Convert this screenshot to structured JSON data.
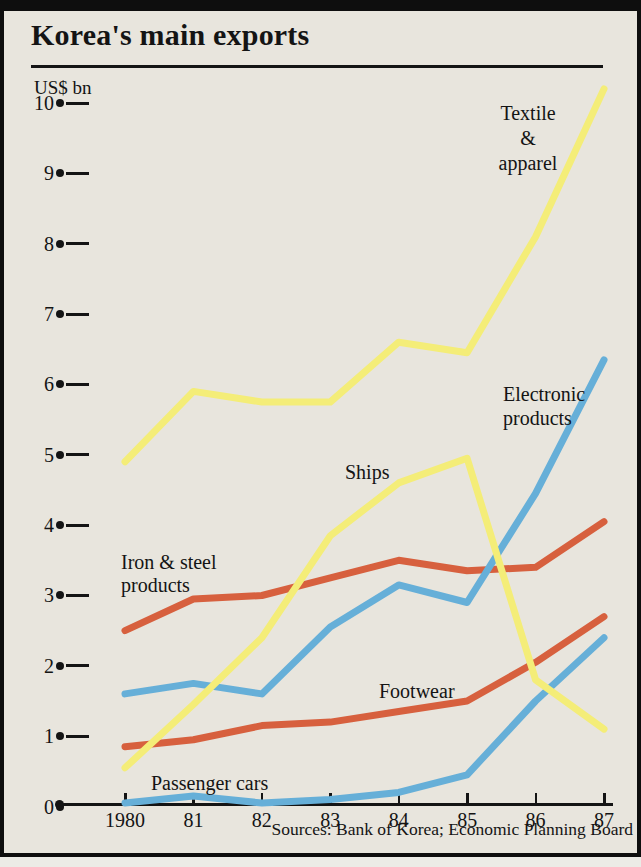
{
  "title": "Korea's main exports",
  "unit_label": "US$ bn",
  "source_line": "Sources: Bank of Korea; Economic Planning Board",
  "colors": {
    "paper": "#e8e5dd",
    "frame": "#0e0e0e",
    "ink": "#141414",
    "yellow": "#f4ed78",
    "blue": "#66afd8",
    "red": "#d7603e"
  },
  "chart_data": {
    "type": "line",
    "title": "Korea's main exports",
    "ylabel": "US$ bn",
    "ylim": [
      0,
      10
    ],
    "y_ticks": [
      0,
      1,
      2,
      3,
      4,
      5,
      6,
      7,
      8,
      9,
      10
    ],
    "grid": false,
    "legend_position": "inline-labels",
    "categories": [
      "1980",
      "81",
      "82",
      "83",
      "84",
      "85",
      "86",
      "87"
    ],
    "series": [
      {
        "name": "Iron & steel products",
        "label": "Iron & steel\nproducts",
        "color_key": "red",
        "values": [
          2.5,
          2.95,
          3.0,
          3.25,
          3.5,
          3.35,
          3.4,
          4.05
        ]
      },
      {
        "name": "Footwear",
        "label": "Footwear",
        "color_key": "red",
        "values": [
          0.85,
          0.95,
          1.15,
          1.2,
          1.35,
          1.5,
          2.05,
          2.7
        ]
      },
      {
        "name": "Passenger cars",
        "label": "Passenger cars",
        "color_key": "blue",
        "values": [
          0.05,
          0.15,
          0.05,
          0.1,
          0.2,
          0.45,
          1.5,
          2.4
        ]
      },
      {
        "name": "Electronic products",
        "label": "Electronic\nproducts",
        "color_key": "blue",
        "values": [
          1.6,
          1.75,
          1.6,
          2.55,
          3.15,
          2.9,
          4.45,
          6.35
        ]
      },
      {
        "name": "Ships",
        "label": "Ships",
        "color_key": "yellow",
        "values": [
          0.55,
          1.45,
          2.4,
          3.85,
          4.6,
          4.95,
          1.8,
          1.1
        ]
      },
      {
        "name": "Textile & apparel",
        "label": "Textile\n&\napparel",
        "color_key": "yellow",
        "values": [
          4.9,
          5.9,
          5.75,
          5.75,
          6.6,
          6.45,
          8.1,
          10.2
        ]
      }
    ]
  }
}
